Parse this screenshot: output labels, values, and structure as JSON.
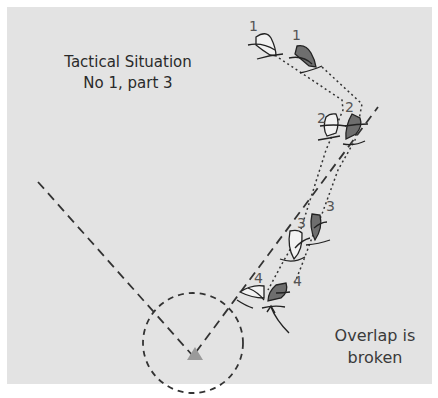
{
  "title": {
    "line1": "Tactical Situation",
    "line2": "No 1, part 3"
  },
  "annotation": {
    "line1": "Overlap is",
    "line2": "broken"
  },
  "boat_positions": [
    {
      "label": "1",
      "white_boat": "1",
      "dark_boat": "1"
    },
    {
      "label": "2",
      "white_boat": "2",
      "dark_boat": "2"
    },
    {
      "label": "3",
      "white_boat": "3",
      "dark_boat": "3"
    },
    {
      "label": "4",
      "white_boat": "4",
      "dark_boat": "4"
    }
  ],
  "colors": {
    "background": "#e3e3e3",
    "dark_boat": "#6e6e6e",
    "white_boat": "#f2f2f2",
    "mark": "#9a9a9a",
    "lines": "#333333"
  },
  "elements": {
    "mark": "triangle-mark",
    "zone": "dashed-circle-zone",
    "laylines": "dashed-laylines",
    "tracks": "dotted-boat-tracks"
  }
}
